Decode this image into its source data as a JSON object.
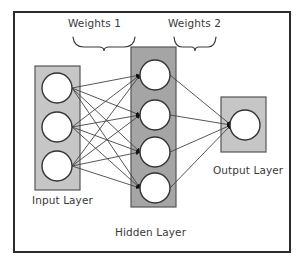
{
  "diagram": {
    "labels": {
      "weights_1": "Weights 1",
      "weights_2": "Weights 2",
      "input_layer": "Input Layer",
      "hidden_layer": "Hidden Layer",
      "output_layer": "Output Layer"
    },
    "colors": {
      "frame_border": "#2b2b2b",
      "background": "#ffffff",
      "input_box_fill": "#c6c6c6",
      "hidden_box_fill": "#a5a5a5",
      "output_box_fill": "#c6c6c6",
      "box_stroke": "#555555",
      "node_fill": "#ffffff",
      "node_stroke": "#333333",
      "edge_stroke": "#444444",
      "text": "#3a3a3a",
      "brace_stroke": "#3a3a3a"
    },
    "layers": [
      {
        "name": "input",
        "label": "Input Layer",
        "node_count": 3,
        "box": {
          "x": 35,
          "y": 66,
          "w": 45,
          "h": 124
        },
        "nodes": [
          {
            "cx": 57,
            "cy": 88,
            "r": 15
          },
          {
            "cx": 57,
            "cy": 127,
            "r": 15
          },
          {
            "cx": 57,
            "cy": 166,
            "r": 15
          }
        ]
      },
      {
        "name": "hidden",
        "label": "Hidden Layer",
        "node_count": 4,
        "box": {
          "x": 131,
          "y": 47,
          "w": 45,
          "h": 160
        },
        "nodes": [
          {
            "cx": 155,
            "cy": 75,
            "r": 15
          },
          {
            "cx": 155,
            "cy": 115,
            "r": 15
          },
          {
            "cx": 155,
            "cy": 152,
            "r": 15
          },
          {
            "cx": 155,
            "cy": 188,
            "r": 15
          }
        ]
      },
      {
        "name": "output",
        "label": "Output Layer",
        "node_count": 1,
        "box": {
          "x": 221,
          "y": 97,
          "w": 45,
          "h": 55
        },
        "nodes": [
          {
            "cx": 245,
            "cy": 125,
            "r": 15
          }
        ]
      }
    ],
    "connections": {
      "weights_1": {
        "label": "Weights 1",
        "from_layer": "input",
        "to_layer": "hidden",
        "fully_connected": true,
        "edge_count": 12
      },
      "weights_2": {
        "label": "Weights 2",
        "from_layer": "hidden",
        "to_layer": "output",
        "fully_connected": true,
        "edge_count": 4
      }
    },
    "braces": [
      {
        "name": "brace-weights-1",
        "x1": 73,
        "x2": 135,
        "y": 38,
        "tip_x": 104,
        "tip_y": 50
      },
      {
        "name": "brace-weights-2",
        "x1": 174,
        "x2": 216,
        "y": 38,
        "tip_x": 195,
        "tip_y": 50
      }
    ]
  }
}
